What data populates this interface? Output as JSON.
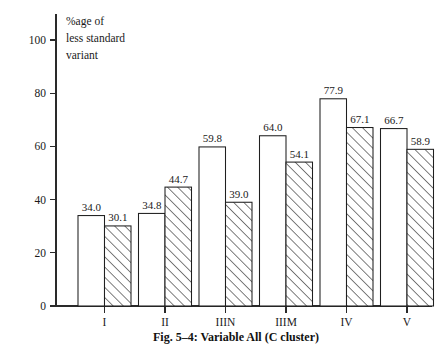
{
  "figure": {
    "caption": "Fig. 5–4:  Variable All (C cluster)",
    "axis_title_lines": [
      "%age of",
      "less standard",
      "variant"
    ]
  },
  "chart_data": {
    "type": "bar",
    "title": "Fig. 5–4:  Variable All (C cluster)",
    "xlabel": "",
    "ylabel": "%age of less standard variant",
    "categories": [
      "I",
      "II",
      "IIIN",
      "IIIM",
      "IV",
      "V"
    ],
    "series": [
      {
        "name": "series-1",
        "style": "open",
        "values": [
          34.0,
          34.8,
          59.8,
          64.0,
          77.9,
          66.7
        ],
        "labels": [
          "34.0",
          "34.8",
          "59.8",
          "64.0",
          "77.9",
          "66.7"
        ]
      },
      {
        "name": "series-2",
        "style": "hatched",
        "values": [
          30.1,
          44.7,
          39.0,
          54.1,
          67.1,
          58.9
        ],
        "labels": [
          "30.1",
          "44.7",
          "39.0",
          "54.1",
          "67.1",
          "58.9"
        ]
      }
    ],
    "ylim": [
      0,
      108
    ],
    "yticks": [
      0,
      20,
      40,
      60,
      80,
      100
    ],
    "ytick_labels": [
      "0",
      "20",
      "40",
      "60",
      "80",
      "100"
    ],
    "grid": false,
    "legend": "none"
  }
}
